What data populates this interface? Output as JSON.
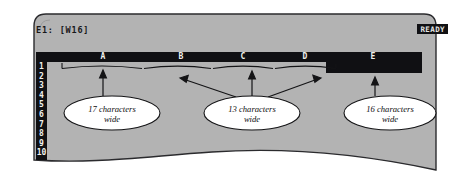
{
  "app": {
    "type": "spreadsheet-screenshot",
    "mode_indicator": "READY",
    "cell_reference": "E1: [W16]"
  },
  "colors": {
    "panel": "#b3b3b3",
    "panel_dark": "#101013",
    "panel_border": "#2b2b2e",
    "text_light": "#f2f2ee",
    "text_dark": "#0c0c0e",
    "callout_fill": "#ffffff",
    "page_background": "#ffffff"
  },
  "worksheet": {
    "columns": [
      {
        "letter": "A",
        "center_x": 103
      },
      {
        "letter": "B",
        "center_x": 181
      },
      {
        "letter": "C",
        "center_x": 243
      },
      {
        "letter": "D",
        "center_x": 305
      },
      {
        "letter": "E",
        "center_x": 373
      }
    ],
    "rows": [
      "1",
      "2",
      "3",
      "4",
      "5",
      "6",
      "7",
      "8",
      "9",
      "10"
    ]
  },
  "annotations": [
    {
      "id": "callout-17",
      "text_line1": "17 characters",
      "text_line2": "wide",
      "cx": 112,
      "cy": 113,
      "rx": 48,
      "ry": 17
    },
    {
      "id": "callout-13",
      "text_line1": "13 characters",
      "text_line2": "wide",
      "cx": 252,
      "cy": 113,
      "rx": 48,
      "ry": 17
    },
    {
      "id": "callout-16",
      "text_line1": "16 characters",
      "text_line2": "wide",
      "cx": 390,
      "cy": 113,
      "rx": 46,
      "ry": 17
    }
  ]
}
